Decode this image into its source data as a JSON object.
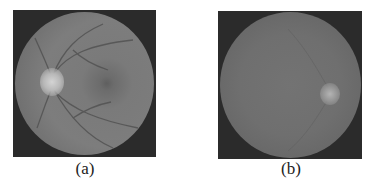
{
  "figure": {
    "panels": [
      {
        "id": "a",
        "caption": "(a)",
        "description": "Color fundus retinal image shown in grayscale with visible optic disc on the left, blood vessels and macula",
        "colors": {
          "background": "#2b2b2b",
          "fundus": "#7a7a7a",
          "optic_disc": "#c8c8c8",
          "macula": "#5e5e5e",
          "vessels": "#4a4a4a"
        }
      },
      {
        "id": "b",
        "caption": "(b)",
        "description": "Fundus retinal image with low contrast; faint bright optic disc on the right and barely visible vessels",
        "colors": {
          "background": "#2b2b2b",
          "fundus": "#6e6e6e",
          "optic_disc": "#a8a8a8"
        }
      }
    ]
  }
}
